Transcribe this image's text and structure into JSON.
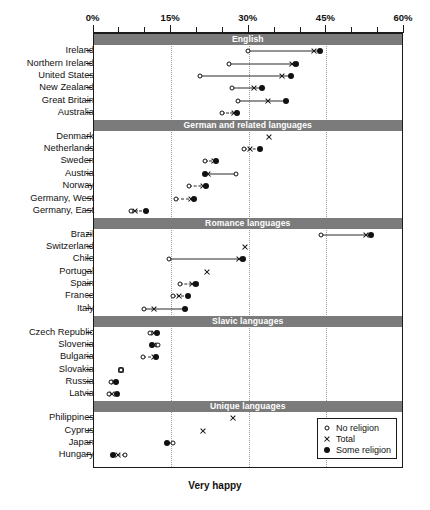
{
  "chart_data": {
    "type": "scatter",
    "title": "",
    "xlabel": "Very happy",
    "ylabel": "",
    "xlim": [
      0,
      60
    ],
    "xticks": [
      0,
      15,
      30,
      45,
      60
    ],
    "xticklabels": [
      "0%",
      "15%",
      "30%",
      "45%",
      "60%"
    ],
    "minor_tick_step": 5,
    "grid": "vertical dotted at 15%, 30%, 45%",
    "legend": {
      "position": "bottom-right inside plot",
      "entries": [
        {
          "marker": "open-circle",
          "label": "No religion"
        },
        {
          "marker": "x",
          "label": "Total"
        },
        {
          "marker": "filled-circle",
          "label": "Some religion"
        }
      ]
    },
    "series_names": [
      "No religion",
      "Total",
      "Some religion"
    ],
    "groups": [
      {
        "name": "English",
        "rows": [
          {
            "label": "Ireland",
            "no_religion": 29.9,
            "total": 42.6,
            "some_religion": 43.8
          },
          {
            "label": "Northern Ireland",
            "no_religion": 26.2,
            "total": 38.4,
            "some_religion": 39.2
          },
          {
            "label": "United States",
            "no_religion": 20.5,
            "total": 36.4,
            "some_religion": 38.2
          },
          {
            "label": "New Zealand",
            "no_religion": 26.8,
            "total": 31.0,
            "some_religion": 32.5
          },
          {
            "label": "Great Britain",
            "no_religion": 28.0,
            "total": 33.8,
            "some_religion": 37.2
          },
          {
            "label": "Australia",
            "no_religion": 24.8,
            "total": 27.2,
            "some_religion": 27.8
          }
        ]
      },
      {
        "name": "German and related languages",
        "rows": [
          {
            "label": "Denmark",
            "no_religion": null,
            "total": 33.9,
            "some_religion": null
          },
          {
            "label": "Netherlands",
            "no_religion": 29.0,
            "total": 30.2,
            "some_religion": 32.2
          },
          {
            "label": "Sweden",
            "no_religion": 21.5,
            "total": 23.2,
            "some_religion": 23.7
          },
          {
            "label": "Austria",
            "no_religion": 27.5,
            "total": 22.2,
            "some_religion": 21.5
          },
          {
            "label": "Norway",
            "no_religion": 18.5,
            "total": 21.2,
            "some_religion": 21.8
          },
          {
            "label": "Germany, West",
            "no_religion": 16.0,
            "total": 18.8,
            "some_religion": 19.4
          },
          {
            "label": "Germany, East",
            "no_religion": 7.2,
            "total": 8.0,
            "some_religion": 10.2
          }
        ]
      },
      {
        "name": "Romance languages",
        "rows": [
          {
            "label": "Brazil",
            "no_religion": 43.9,
            "total": 52.6,
            "some_religion": 53.6
          },
          {
            "label": "Switzerland",
            "no_religion": null,
            "total": 29.2,
            "some_religion": null
          },
          {
            "label": "Chile",
            "no_religion": 14.6,
            "total": 28.2,
            "some_religion": 28.8
          },
          {
            "label": "Portugal",
            "no_religion": null,
            "total": 22.0,
            "some_religion": null
          },
          {
            "label": "Spain",
            "no_religion": 16.8,
            "total": 19.0,
            "some_religion": 19.8
          },
          {
            "label": "France",
            "no_religion": 15.4,
            "total": 16.6,
            "some_religion": 18.2
          },
          {
            "label": "Italy",
            "no_religion": 9.8,
            "total": 11.6,
            "some_religion": 17.6
          }
        ]
      },
      {
        "name": "Slavic languages",
        "rows": [
          {
            "label": "Czech Republic",
            "no_religion": 11.0,
            "total": 11.6,
            "some_religion": 12.2
          },
          {
            "label": "Slovenia",
            "no_religion": 12.4,
            "total": 11.6,
            "some_religion": 11.4
          },
          {
            "label": "Bulgaria",
            "no_religion": 9.6,
            "total": 11.6,
            "some_religion": 12.0
          },
          {
            "label": "Slovakia",
            "no_religion": 5.3,
            "total": 5.3,
            "some_religion": 5.3
          },
          {
            "label": "Russia",
            "no_religion": 3.4,
            "total": 4.0,
            "some_religion": 4.4
          },
          {
            "label": "Latvia",
            "no_religion": 3.0,
            "total": 3.6,
            "some_religion": 4.6
          }
        ]
      },
      {
        "name": "Unique languages",
        "rows": [
          {
            "label": "Philippines",
            "no_religion": null,
            "total": 27.0,
            "some_religion": null
          },
          {
            "label": "Cyprus",
            "no_religion": null,
            "total": 21.2,
            "some_religion": null
          },
          {
            "label": "Japan",
            "no_religion": 15.4,
            "total": null,
            "some_religion": 14.2
          },
          {
            "label": "Hungary",
            "no_religion": 6.1,
            "total": 4.8,
            "some_religion": 3.8
          }
        ]
      }
    ]
  },
  "colors": {
    "band_fill": "#7b7b7b",
    "band_text": "#ffffff",
    "mark": "#111111",
    "grid": "#9a9a9a",
    "frame": "#1a1a1a"
  }
}
